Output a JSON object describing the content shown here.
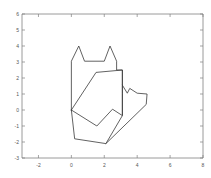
{
  "chart_data": {
    "type": "line",
    "title": "",
    "xlabel": "",
    "ylabel": "",
    "xlim": [
      -3,
      8
    ],
    "ylim": [
      -3,
      6
    ],
    "grid": false,
    "legend": null,
    "background": "#ffffff",
    "line_color": "#3a3a3a",
    "axis_color": "#808080",
    "xticks": [
      -2,
      0,
      2,
      4,
      6,
      8
    ],
    "xticklabels": [
      "-2",
      "0",
      "2",
      "4",
      "6",
      "8"
    ],
    "yticks": [
      -3,
      -2,
      -1,
      0,
      1,
      2,
      3,
      4,
      5,
      6
    ],
    "yticklabels": [
      "-3",
      "-2",
      "-1",
      "0",
      "1",
      "2",
      "3",
      "4",
      "5",
      "6"
    ],
    "series": [
      {
        "name": "outer-outline",
        "closed": true,
        "x": [
          0.0,
          0.0,
          0.45,
          0.8,
          0.8,
          2.0,
          2.0,
          2.35,
          2.75,
          2.75,
          3.1,
          3.1,
          3.1,
          3.1,
          2.1,
          0.2,
          0.0
        ],
        "y": [
          0.0,
          3.05,
          4.0,
          3.05,
          3.05,
          3.05,
          3.05,
          4.0,
          3.05,
          2.5,
          2.5,
          1.55,
          1.05,
          -0.35,
          -2.1,
          -1.8,
          0.0
        ]
      },
      {
        "name": "inner-polygon",
        "closed": false,
        "x": [
          0.0,
          1.5,
          3.1,
          3.1,
          3.1,
          2.5,
          1.55,
          0.0
        ],
        "y": [
          0.0,
          2.35,
          2.5,
          1.55,
          -0.35,
          0.05,
          -1.0,
          0.0
        ]
      },
      {
        "name": "right-wing",
        "closed": false,
        "x": [
          3.1,
          3.4,
          3.55,
          4.0,
          4.6,
          4.55,
          2.1
        ],
        "y": [
          1.55,
          1.05,
          1.35,
          1.05,
          1.0,
          0.35,
          -2.1
        ]
      }
    ]
  },
  "axes": {
    "plot_left_px": 22,
    "plot_right_px": 203,
    "plot_top_px": 14,
    "plot_bottom_px": 158
  }
}
